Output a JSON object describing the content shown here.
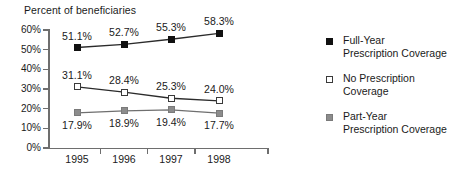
{
  "chart_data": {
    "type": "line",
    "title": "Percent of beneficiaries",
    "xlabel": "",
    "ylabel": "Percent of beneficiaries",
    "categories": [
      "1995",
      "1996",
      "1997",
      "1998"
    ],
    "ylim": [
      0,
      60
    ],
    "ytick_labels": [
      "0%",
      "10%",
      "20%",
      "30%",
      "40%",
      "50%",
      "60%"
    ],
    "ytick_values": [
      0,
      10,
      20,
      30,
      40,
      50,
      60
    ],
    "grid": false,
    "legend_position": "right",
    "series": [
      {
        "name": "Full-Year Prescription Coverage",
        "marker": "filled-square",
        "color": "#111111",
        "values": [
          51.1,
          52.7,
          55.3,
          58.3
        ],
        "labels": [
          "51.1%",
          "52.7%",
          "55.3%",
          "58.3%"
        ],
        "label_position": "above"
      },
      {
        "name": "No Prescription Coverage",
        "marker": "open-square",
        "color": "#3a3a3a",
        "values": [
          31.1,
          28.4,
          25.3,
          24.0
        ],
        "labels": [
          "31.1%",
          "28.4%",
          "25.3%",
          "24.0%"
        ],
        "label_position": "above"
      },
      {
        "name": "Part-Year Prescription Coverage",
        "marker": "gray-square",
        "color": "#8c8c8c",
        "values": [
          17.9,
          18.9,
          19.4,
          17.7
        ],
        "labels": [
          "17.9%",
          "18.9%",
          "19.4%",
          "17.7%"
        ],
        "label_position": "below"
      }
    ]
  },
  "legend": {
    "items": [
      {
        "marker": "full",
        "line1": "Full-Year",
        "line2": "Prescription Coverage"
      },
      {
        "marker": "none",
        "line1": "No Prescription",
        "line2": "Coverage"
      },
      {
        "marker": "part",
        "line1": "Part-Year",
        "line2": "Prescription Coverage"
      }
    ]
  }
}
